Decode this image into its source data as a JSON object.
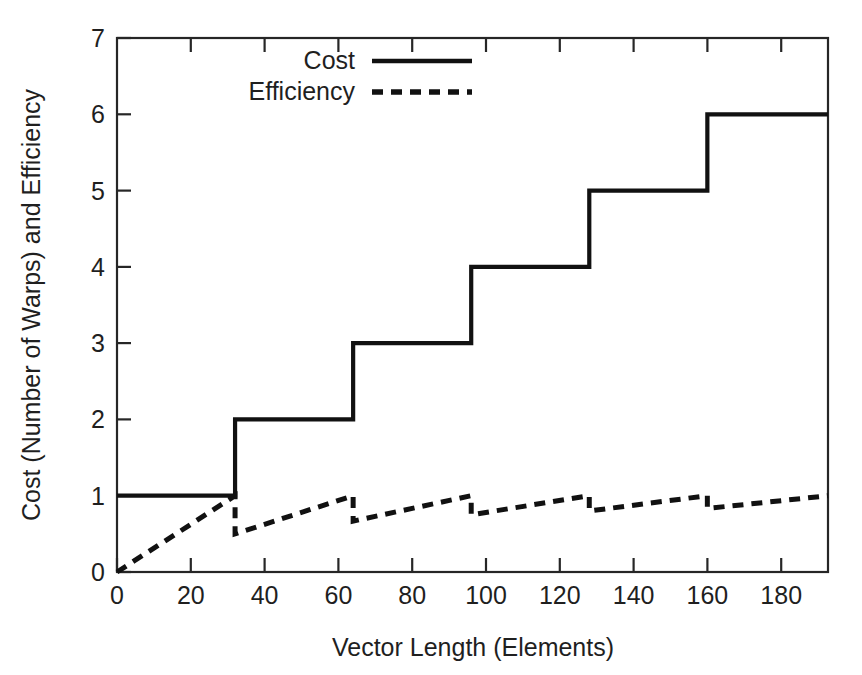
{
  "chart_data": {
    "type": "line",
    "title": "",
    "xlabel": "Vector Length (Elements)",
    "ylabel": "Cost (Number of Warps) and Efficiency",
    "xlim": [
      0,
      192.7
    ],
    "ylim": [
      0,
      7
    ],
    "xticks": [
      0,
      20,
      40,
      60,
      80,
      100,
      120,
      140,
      160,
      180
    ],
    "xtick_labels": [
      "0",
      "20",
      "40",
      "60",
      "80",
      "100",
      "120",
      "140",
      "160",
      "180"
    ],
    "yticks": [
      0,
      1,
      2,
      3,
      4,
      5,
      6,
      7
    ],
    "ytick_labels": [
      "0",
      "1",
      "2",
      "3",
      "4",
      "5",
      "6",
      "7"
    ],
    "grid": false,
    "legend_position": "upper-center-inside",
    "warp_size": 32,
    "series": [
      {
        "name": "Cost",
        "style": "solid",
        "color": "#111111",
        "description": "Step function: number of warps = ceil(vector_length / 32)",
        "steps": [
          {
            "x_start": 0,
            "x_end": 32,
            "value": 1
          },
          {
            "x_start": 32,
            "x_end": 64,
            "value": 2
          },
          {
            "x_start": 64,
            "x_end": 96,
            "value": 3
          },
          {
            "x_start": 96,
            "x_end": 128,
            "value": 4
          },
          {
            "x_start": 128,
            "x_end": 160,
            "value": 5
          },
          {
            "x_start": 160,
            "x_end": 192.7,
            "value": 6
          }
        ],
        "points": [
          {
            "x": 0,
            "y": 1
          },
          {
            "x": 32,
            "y": 1
          },
          {
            "x": 32,
            "y": 2
          },
          {
            "x": 64,
            "y": 2
          },
          {
            "x": 64,
            "y": 3
          },
          {
            "x": 96,
            "y": 3
          },
          {
            "x": 96,
            "y": 4
          },
          {
            "x": 128,
            "y": 4
          },
          {
            "x": 128,
            "y": 5
          },
          {
            "x": 160,
            "y": 5
          },
          {
            "x": 160,
            "y": 6
          },
          {
            "x": 192.7,
            "y": 6
          }
        ]
      },
      {
        "name": "Efficiency",
        "style": "dashed",
        "color": "#111111",
        "description": "Sawtooth: efficiency = vector_length / (32 * ceil(vector_length / 32))",
        "points": [
          {
            "x": 0,
            "y": 0
          },
          {
            "x": 32,
            "y": 1.0
          },
          {
            "x": 32,
            "y": 0.5
          },
          {
            "x": 64,
            "y": 1.0
          },
          {
            "x": 64,
            "y": 0.667
          },
          {
            "x": 96,
            "y": 1.0
          },
          {
            "x": 96,
            "y": 0.75
          },
          {
            "x": 128,
            "y": 1.0
          },
          {
            "x": 128,
            "y": 0.8
          },
          {
            "x": 160,
            "y": 1.0
          },
          {
            "x": 160,
            "y": 0.833
          },
          {
            "x": 192.7,
            "y": 1.0
          }
        ],
        "sawtooth_minima": [
          0.5,
          0.667,
          0.75,
          0.8,
          0.833
        ],
        "sawtooth_peaks": [
          1.0,
          1.0,
          1.0,
          1.0,
          1.0
        ]
      }
    ]
  },
  "legend": {
    "entries": [
      {
        "label": "Cost",
        "style": "solid"
      },
      {
        "label": "Efficiency",
        "style": "dashed"
      }
    ]
  },
  "axes": {
    "x_title": "Vector Length (Elements)",
    "y_title": "Cost (Number of Warps) and Efficiency"
  }
}
